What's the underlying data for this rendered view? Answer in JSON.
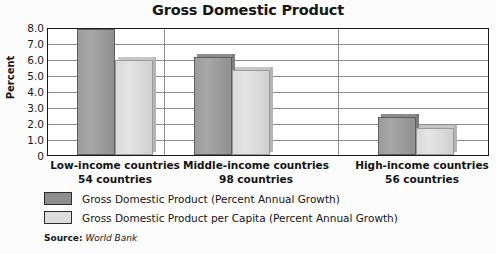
{
  "chart_data": {
    "type": "bar",
    "title": "Gross Domestic Product",
    "xlabel": "",
    "ylabel": "Percent",
    "ylim": [
      0,
      8.0
    ],
    "yticks": [
      "0",
      "1.0",
      "2.0",
      "3.0",
      "4.0",
      "5.0",
      "6.0",
      "7.0",
      "8.0"
    ],
    "ytick_values": [
      0,
      1.0,
      2.0,
      3.0,
      4.0,
      5.0,
      6.0,
      7.0,
      8.0
    ],
    "grid": true,
    "legend_position": "below-axes-left",
    "categories": [
      "Low-income countries",
      "Middle-income countries",
      "High-income countries"
    ],
    "category_sublabels": [
      "54 countries",
      "98 countries",
      "56 countries"
    ],
    "series": [
      {
        "name": "Gross Domestic Product (Percent Annual Growth)",
        "color": "#8d8d8d",
        "values": [
          8.0,
          6.2,
          2.4
        ]
      },
      {
        "name": "Gross Domestic Product per Capita (Percent Annual Growth)",
        "color": "#dcdcdc",
        "values": [
          6.0,
          5.4,
          1.7
        ]
      }
    ],
    "source_label": "Source:",
    "source_value": "World Bank"
  }
}
